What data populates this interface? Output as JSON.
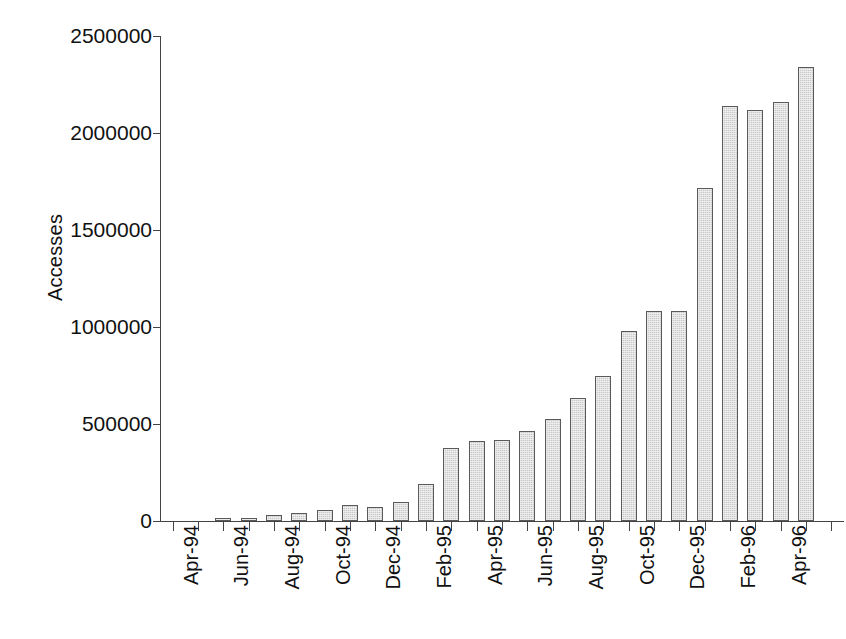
{
  "chart_data": {
    "type": "bar",
    "title": "",
    "xlabel": "",
    "ylabel": "Accesses",
    "ylim": [
      0,
      2500000
    ],
    "ytick_values": [
      0,
      500000,
      1000000,
      1500000,
      2000000,
      2500000
    ],
    "ytick_labels": [
      "0",
      "500000",
      "1000000",
      "1500000",
      "2000000",
      "2500000"
    ],
    "grid": false,
    "legend": false,
    "xtick_label_rotation": 90,
    "xtick_labels_shown": [
      "Apr-94",
      "Jun-94",
      "Aug-94",
      "Oct-94",
      "Dec-94",
      "Feb-95",
      "Apr-95",
      "Jun-95",
      "Aug-95",
      "Oct-95",
      "Dec-95",
      "Feb-96",
      "Apr-96"
    ],
    "categories": [
      "Apr-94",
      "May-94",
      "Jun-94",
      "Jul-94",
      "Aug-94",
      "Sep-94",
      "Oct-94",
      "Nov-94",
      "Dec-94",
      "Jan-95",
      "Feb-95",
      "Mar-95",
      "Apr-95",
      "May-95",
      "Jun-95",
      "Jul-95",
      "Aug-95",
      "Sep-95",
      "Oct-95",
      "Nov-95",
      "Dec-95",
      "Jan-96",
      "Feb-96",
      "Mar-96",
      "Apr-96",
      "May-96",
      "Jun-96"
    ],
    "values": [
      0,
      0,
      15000,
      18000,
      30000,
      42000,
      58000,
      83000,
      72000,
      97000,
      193000,
      378000,
      412000,
      418000,
      465000,
      525000,
      632000,
      748000,
      980000,
      1080000,
      1080000,
      1715000,
      2140000,
      2120000,
      2160000,
      2340000,
      0
    ],
    "bar_fill_color": "#c9c9c9",
    "bar_border_color": "#5a5a5a",
    "background_color": "#ffffff",
    "axis_color": "#444444"
  }
}
